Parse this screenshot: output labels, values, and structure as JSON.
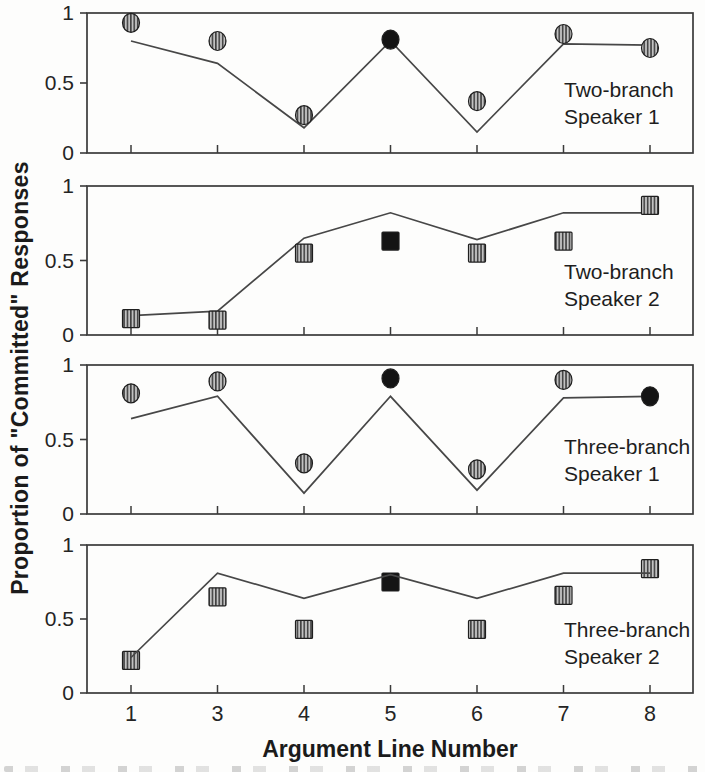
{
  "figure": {
    "y_axis_label": "Proportion of \"Committed\" Responses",
    "x_axis_label": "Argument Line Number",
    "x_ticks": [
      "1",
      "3",
      "4",
      "5",
      "6",
      "7",
      "8"
    ],
    "y_ticks": [
      "1",
      "0.5",
      "0"
    ],
    "colors": {
      "frame": "#3a3a3a",
      "fit_line": "#474747",
      "marker_outline": "#1f1f1f",
      "marker_black": "#141414",
      "marker_hatch_bg": "#c2c2c2",
      "marker_hatch_stripe": "#3a3a3a",
      "text": "#242424"
    }
  },
  "chart_data": [
    {
      "type": "line+scatter",
      "title": "Two-branch Speaker 1",
      "label_lines": [
        "Two-branch",
        "Speaker 1"
      ],
      "marker": "circle",
      "x": [
        1,
        3,
        4,
        5,
        6,
        7,
        8
      ],
      "observed_points": [
        0.93,
        0.8,
        0.27,
        0.81,
        0.37,
        0.85,
        0.75
      ],
      "model_line": [
        0.8,
        0.64,
        0.18,
        0.8,
        0.15,
        0.78,
        0.77
      ],
      "filled_black_x": [
        5
      ],
      "ylim": [
        0,
        1
      ],
      "xlabel": "Argument Line Number",
      "ylabel": "Proportion of \"Committed\" Responses",
      "grid": false,
      "legend": "none"
    },
    {
      "type": "line+scatter",
      "title": "Two-branch Speaker 2",
      "label_lines": [
        "Two-branch",
        "Speaker 2"
      ],
      "marker": "square",
      "x": [
        1,
        3,
        4,
        5,
        6,
        7,
        8
      ],
      "observed_points": [
        0.11,
        0.1,
        0.55,
        0.63,
        0.55,
        0.63,
        0.87
      ],
      "model_line": [
        0.13,
        0.16,
        0.65,
        0.82,
        0.64,
        0.82,
        0.82
      ],
      "filled_black_x": [
        5
      ],
      "ylim": [
        0,
        1
      ],
      "xlabel": "Argument Line Number",
      "ylabel": "Proportion of \"Committed\" Responses",
      "grid": false,
      "legend": "none"
    },
    {
      "type": "line+scatter",
      "title": "Three-branch Speaker 1",
      "label_lines": [
        "Three-branch",
        "Speaker 1"
      ],
      "marker": "circle",
      "x": [
        1,
        3,
        4,
        5,
        6,
        7,
        8
      ],
      "observed_points": [
        0.81,
        0.89,
        0.34,
        0.91,
        0.3,
        0.9,
        0.79
      ],
      "model_line": [
        0.64,
        0.79,
        0.14,
        0.79,
        0.16,
        0.78,
        0.79
      ],
      "filled_black_x": [
        5,
        8
      ],
      "ylim": [
        0,
        1
      ],
      "xlabel": "Argument Line Number",
      "ylabel": "Proportion of \"Committed\" Responses",
      "grid": false,
      "legend": "none"
    },
    {
      "type": "line+scatter",
      "title": "Three-branch Speaker 2",
      "label_lines": [
        "Three-branch",
        "Speaker 2"
      ],
      "marker": "square",
      "x": [
        1,
        3,
        4,
        5,
        6,
        7,
        8
      ],
      "observed_points": [
        0.22,
        0.65,
        0.43,
        0.75,
        0.43,
        0.66,
        0.84
      ],
      "model_line": [
        0.24,
        0.81,
        0.64,
        0.8,
        0.64,
        0.81,
        0.81
      ],
      "filled_black_x": [
        5
      ],
      "ylim": [
        0,
        1
      ],
      "xlabel": "Argument Line Number",
      "ylabel": "Proportion of \"Committed\" Responses",
      "grid": false,
      "legend": "none"
    }
  ]
}
